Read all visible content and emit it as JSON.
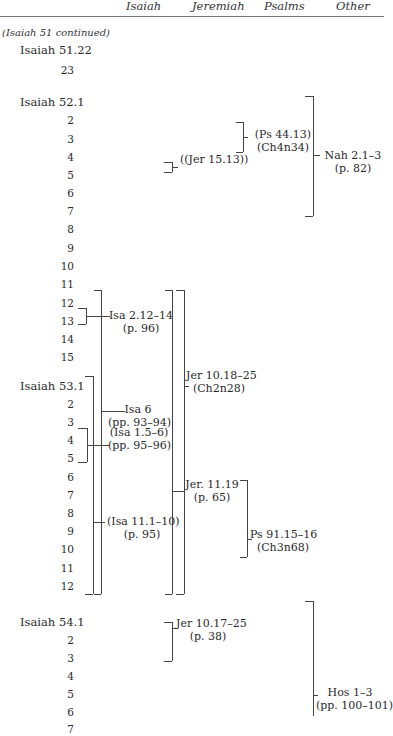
{
  "header": {
    "columns": [
      "Isaiah",
      "Jeremiah",
      "Psalms",
      "Other"
    ]
  },
  "continued_label": "(Isaiah 51 continued)",
  "verses": {
    "isaiah_51_22": "Isaiah 51.22",
    "v51_23": "23",
    "isaiah_52_1": "Isaiah 52.1",
    "ch52": [
      "2",
      "3",
      "4",
      "5",
      "6",
      "7",
      "8",
      "9",
      "10",
      "11",
      "12",
      "13",
      "14",
      "15"
    ],
    "isaiah_53_1": "Isaiah 53.1",
    "ch53": [
      "2",
      "3",
      "4",
      "5",
      "6",
      "7",
      "8",
      "9",
      "10",
      "11",
      "12"
    ],
    "isaiah_54_1": "Isaiah 54.1",
    "ch54": [
      "2",
      "3",
      "4",
      "5",
      "6",
      "7"
    ]
  },
  "annotations": {
    "ps_44_13": {
      "ref": "(Ps 44.13)",
      "note": "(Ch4n34)"
    },
    "jer_15_13": {
      "ref": "((Jer 15.13))"
    },
    "nah_2_1_3": {
      "ref": "Nah 2.1–3",
      "note": "(p. 82)"
    },
    "isa_2_12_14": {
      "ref": "Isa 2.12–14",
      "note": "(p. 96)"
    },
    "isa_6": {
      "ref": "Isa 6",
      "note": "(pp. 93–94)"
    },
    "isa_1_5_6": {
      "ref": "(Isa 1.5–6)",
      "note": "(pp. 95–96)"
    },
    "isa_11_1_10": {
      "ref": "(Isa 11.1–10)",
      "note": "(p. 95)"
    },
    "jer_10_18_25": {
      "ref": "Jer 10.18–25",
      "note": "(Ch2n28)"
    },
    "jer_11_19": {
      "ref": "Jer. 11.19",
      "note": "(p. 65)"
    },
    "ps_91_15_16": {
      "ref": "Ps 91.15–16",
      "note": "(Ch3n68)"
    },
    "jer_10_17_25": {
      "ref": "Jer 10.17–25",
      "note": "(p. 38)"
    },
    "hos_1_3": {
      "ref": "Hos 1–3",
      "note": "(pp. 100–101)"
    }
  }
}
